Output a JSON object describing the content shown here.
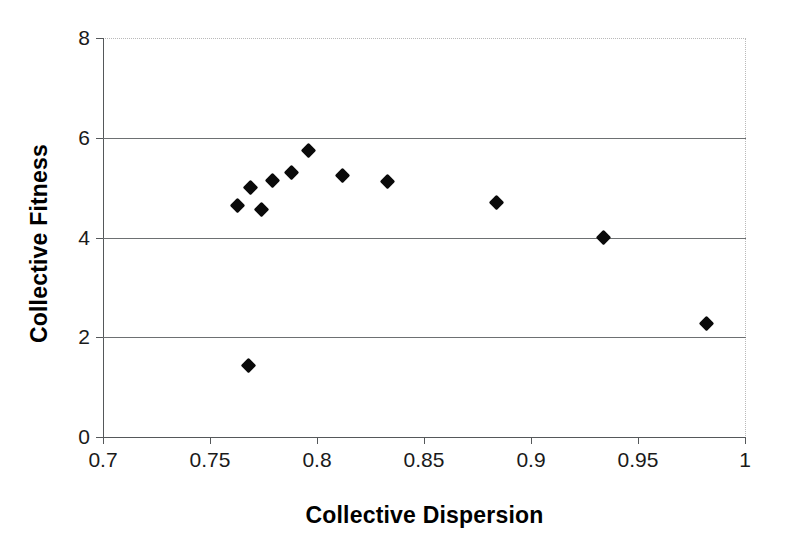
{
  "chart_data": {
    "type": "scatter",
    "title": "",
    "xlabel": "Collective Dispersion",
    "ylabel": "Collective Fitness",
    "xlim": [
      0.7,
      1
    ],
    "ylim": [
      0,
      8
    ],
    "xticks": [
      "0.7",
      "0.75",
      "0.8",
      "0.85",
      "0.9",
      "0.95",
      "1"
    ],
    "xtick_values": [
      0.7,
      0.75,
      0.8,
      0.85,
      0.9,
      0.95,
      1
    ],
    "yticks": [
      "0",
      "2",
      "4",
      "6",
      "8"
    ],
    "ytick_values": [
      0,
      2,
      4,
      6,
      8
    ],
    "gridlines": {
      "horizontal": [
        2,
        4,
        6
      ],
      "vertical": []
    },
    "legend": null,
    "marker_style": "filled-diamond",
    "marker_color": "#0a0a0a",
    "series": [
      {
        "name": "Collective Fitness vs Collective Dispersion",
        "points": [
          {
            "x": 0.763,
            "y": 4.65
          },
          {
            "x": 0.768,
            "y": 1.44
          },
          {
            "x": 0.769,
            "y": 5.01
          },
          {
            "x": 0.774,
            "y": 4.57
          },
          {
            "x": 0.779,
            "y": 5.15
          },
          {
            "x": 0.788,
            "y": 5.31
          },
          {
            "x": 0.796,
            "y": 5.75
          },
          {
            "x": 0.812,
            "y": 5.25
          },
          {
            "x": 0.833,
            "y": 5.13
          },
          {
            "x": 0.884,
            "y": 4.71
          },
          {
            "x": 0.934,
            "y": 3.99
          },
          {
            "x": 0.982,
            "y": 2.27
          }
        ]
      }
    ]
  },
  "style": {
    "background": "#ffffff",
    "axis_color": "#55585a",
    "grid_color": "#6d7072",
    "border_dotted_color": "#b9b9b9",
    "text_color": "#1a1a1a"
  }
}
